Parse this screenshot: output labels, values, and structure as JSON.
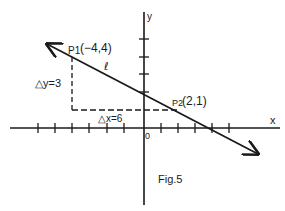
{
  "figure": {
    "caption": "Fig.5",
    "line_label": "ℓ",
    "axes": {
      "x_label": "x",
      "y_label": "y",
      "origin_label": "0",
      "x_ticks_left": 6,
      "x_ticks_right": 5,
      "y_ticks_up": 3
    },
    "points": [
      {
        "name": "P1",
        "sub": "1",
        "label": "(−4,4)",
        "x": -4,
        "y": 4
      },
      {
        "name": "P2",
        "sub": "2",
        "label": "(2,1)",
        "x": 2,
        "y": 1
      }
    ],
    "delta_y": "△y=3",
    "delta_x": "△x=6",
    "colors": {
      "ink": "#1a1a1a",
      "background": "#ffffff"
    }
  }
}
